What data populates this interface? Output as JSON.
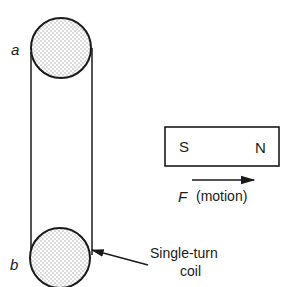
{
  "diagram": {
    "coil": {
      "label_top": "a",
      "label_bottom": "b",
      "callout": [
        "Single-turn",
        "coil"
      ]
    },
    "magnet": {
      "pole_left": "S",
      "pole_right": "N"
    },
    "motion": {
      "force_symbol": "F",
      "description": "(motion)"
    },
    "colors": {
      "stroke": "#1a1a1a",
      "stipple": "#9a9a9a",
      "background": "#ffffff"
    }
  }
}
